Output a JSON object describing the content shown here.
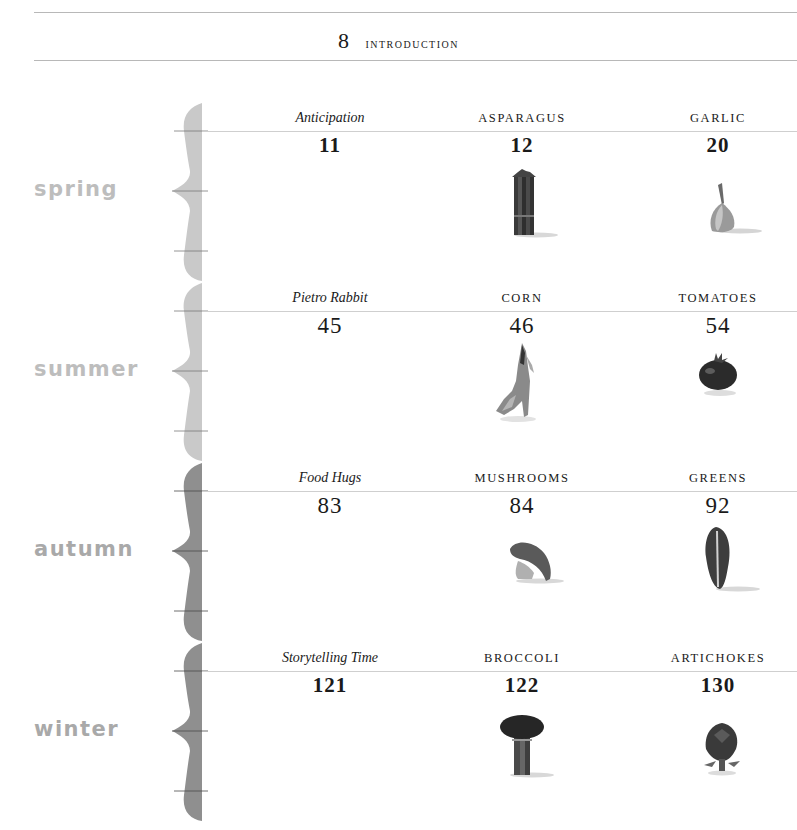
{
  "header": {
    "page_number": "8",
    "label": "INTRODUCTION"
  },
  "colors": {
    "brace_light": "#c9c9c9",
    "brace_dark": "#8f8f8f",
    "label_light": "#bdbdbd",
    "label_dark": "#a9a9a9",
    "rule": "#c8c8c8"
  },
  "seasons": [
    {
      "name": "spring",
      "entries": [
        {
          "title": "Anticipation",
          "page": "11",
          "italic": true
        },
        {
          "title": "ASPARAGUS",
          "page": "12",
          "image": "asparagus-image"
        },
        {
          "title": "GARLIC",
          "page": "20",
          "image": "garlic-image"
        }
      ]
    },
    {
      "name": "summer",
      "entries": [
        {
          "title": "Pietro Rabbit",
          "page": "45",
          "italic": true
        },
        {
          "title": "CORN",
          "page": "46",
          "image": "corn-image"
        },
        {
          "title": "TOMATOES",
          "page": "54",
          "image": "tomato-image"
        }
      ]
    },
    {
      "name": "autumn",
      "entries": [
        {
          "title": "Food Hugs",
          "page": "83",
          "italic": true
        },
        {
          "title": "MUSHROOMS",
          "page": "84",
          "image": "mushroom-image"
        },
        {
          "title": "GREENS",
          "page": "92",
          "image": "greens-image"
        }
      ]
    },
    {
      "name": "winter",
      "entries": [
        {
          "title": "Storytelling Time",
          "page": "121",
          "italic": true
        },
        {
          "title": "BROCCOLI",
          "page": "122",
          "image": "broccoli-image"
        },
        {
          "title": "ARTICHOKES",
          "page": "130",
          "image": "artichoke-image"
        }
      ]
    }
  ]
}
